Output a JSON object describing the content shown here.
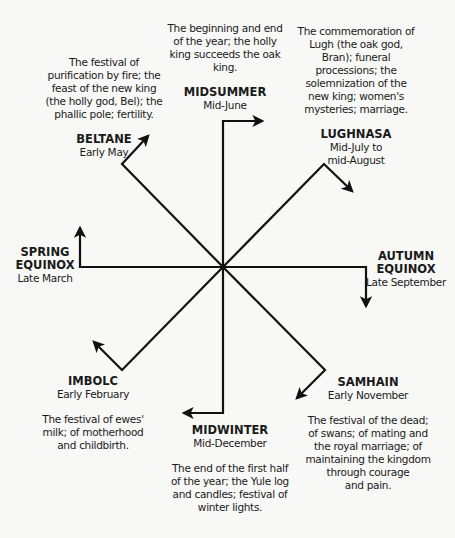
{
  "diagram": {
    "type": "wheel-of-the-year",
    "stroke_color": "#111111",
    "background": "#f8f8f6",
    "festivals": [
      {
        "id": "midsummer",
        "name": "MIDSUMMER",
        "date": "Mid-June",
        "description": [
          "The beginning and end",
          "of the year; the holly",
          "king succeeds the oak",
          "king."
        ]
      },
      {
        "id": "lughnasa",
        "name": "LUGHNASA",
        "date": [
          "Mid-July to",
          "mid-August"
        ],
        "description": [
          "The commemoration of",
          "Lugh (the oak god,",
          "Bran); funeral",
          "processions; the",
          "solemnization of the",
          "new king; women's",
          "mysteries; marriage."
        ]
      },
      {
        "id": "autumn-equinox",
        "name": [
          "AUTUMN",
          "EQUINOX"
        ],
        "date": "Late September"
      },
      {
        "id": "samhain",
        "name": "SAMHAIN",
        "date": "Early November",
        "description": [
          "The festival of the dead;",
          "of swans; of mating and",
          "the royal marriage; of",
          "maintaining the kingdom",
          "through courage",
          "and pain."
        ]
      },
      {
        "id": "midwinter",
        "name": "MIDWINTER",
        "date": "Mid-December",
        "description": [
          "The end of the first half",
          "of the year; the Yule log",
          "and candles; festival of",
          "winter lights."
        ]
      },
      {
        "id": "imbolc",
        "name": "IMBOLC",
        "date": "Early February",
        "description": [
          "The festival of ewes'",
          "milk; of motherhood",
          "and childbirth."
        ]
      },
      {
        "id": "spring-equinox",
        "name": [
          "SPRING",
          "EQUINOX"
        ],
        "date": "Late March"
      },
      {
        "id": "beltane",
        "name": "BELTANE",
        "date": "Early May",
        "description": [
          "The festival of",
          "purification by fire; the",
          "feast of the new king",
          "(the holly god, Bel); the",
          "phallic pole; fertility."
        ]
      }
    ]
  }
}
